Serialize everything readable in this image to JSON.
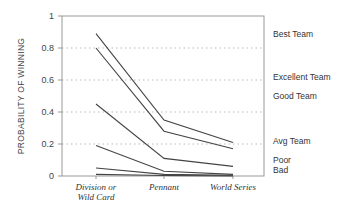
{
  "chart_data": {
    "type": "line",
    "title": "",
    "xlabel": "",
    "ylabel": "PROBABILITY OF WINNING",
    "categories": [
      "Division or Wild Card",
      "Pennant",
      "World Series"
    ],
    "category_lines": [
      [
        "Division or",
        "Wild Card"
      ],
      [
        "Pennant"
      ],
      [
        "World Series"
      ]
    ],
    "ylim": [
      0,
      1
    ],
    "yticks": [
      0,
      0.2,
      0.4,
      0.6,
      0.8,
      1
    ],
    "ytick_labels": [
      "0",
      "0.2",
      "0.4",
      "0.6",
      "0.8",
      "1"
    ],
    "grid": "dotted horizontal at 0.2, 0.4, 0.6, 0.8",
    "legend_position": "right, inline labels",
    "series": [
      {
        "name": "Best Team",
        "values": [
          0.89,
          0.35,
          0.21
        ]
      },
      {
        "name": "Excellent Team",
        "values": [
          0.8,
          0.28,
          0.17
        ]
      },
      {
        "name": "Good Team",
        "values": [
          0.45,
          0.11,
          0.06
        ]
      },
      {
        "name": "Avg Team",
        "values": [
          0.19,
          0.03,
          0.01
        ]
      },
      {
        "name": "Poor",
        "values": [
          0.05,
          0.01,
          0.005
        ]
      },
      {
        "name": "Bad",
        "values": [
          0.01,
          0.003,
          0.001
        ]
      }
    ],
    "label_y_positions": [
      0.885,
      0.62,
      0.5,
      0.22,
      0.1,
      0.04
    ],
    "colors": {
      "line": "#444444",
      "axis": "#999999",
      "grid": "#bbbbbb"
    }
  }
}
